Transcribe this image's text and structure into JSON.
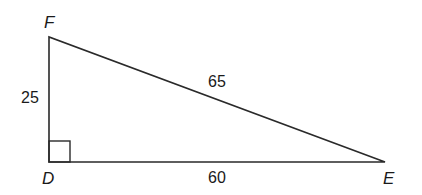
{
  "diagram": {
    "type": "right-triangle",
    "vertices": [
      {
        "name": "F",
        "x": 49,
        "y": 37,
        "label_x": 44,
        "label_y": 28
      },
      {
        "name": "D",
        "x": 49,
        "y": 162,
        "label_x": 42,
        "label_y": 184
      },
      {
        "name": "E",
        "x": 385,
        "y": 162,
        "label_x": 383,
        "label_y": 184
      }
    ],
    "side_labels": {
      "FD": "25",
      "DE": "60",
      "FE": "65"
    },
    "right_angle_at": "D",
    "colors": {
      "stroke": "#2a2a2a",
      "text": "#1a1a1a",
      "background": "#ffffff"
    }
  }
}
